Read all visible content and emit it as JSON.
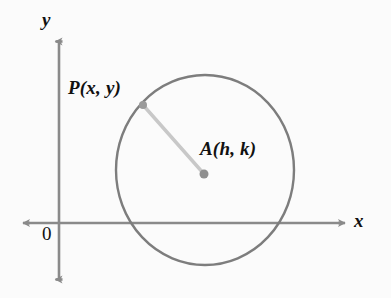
{
  "figure": {
    "kind": "coordinate-plane-circle-diagram",
    "background_color": "#fbfbfb",
    "axis_color": "#8a8a8a",
    "circle_color": "#7d7d7d",
    "radius_color": "#c8c8c8",
    "point_color": "#8f8f8f",
    "label_color": "#111111"
  },
  "axes": {
    "y_label": "y",
    "x_label": "x",
    "origin_label": "0",
    "y_axis": {
      "x": 59,
      "y_top": 38,
      "y_bottom": 283
    },
    "x_axis": {
      "y": 223,
      "x_left": 23,
      "x_right": 345
    }
  },
  "circle": {
    "center_x": 205,
    "center_y": 170,
    "radius_x": 89,
    "radius_y": 95,
    "stroke_width": 2.4
  },
  "points": [
    {
      "name": "P",
      "label": "P(x, y)",
      "cx": 143,
      "cy": 105,
      "r": 4
    },
    {
      "name": "A",
      "label": "A(h, k)",
      "cx": 204,
      "cy": 174,
      "r": 4.5
    }
  ],
  "radius_segment": {
    "from": "P",
    "to": "A",
    "x1": 143,
    "y1": 105,
    "x2": 204,
    "y2": 174,
    "stroke_width": 3.4
  }
}
